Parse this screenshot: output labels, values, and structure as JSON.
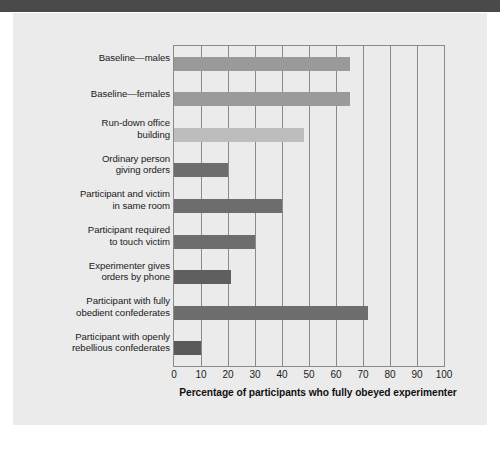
{
  "figure": {
    "panel_bg": "#ebebeb",
    "top_band_color": "#4a4a4a",
    "axis_color": "#8a8a8a"
  },
  "chart_data": {
    "type": "bar",
    "orientation": "horizontal",
    "title": "",
    "xlabel": "Percentage of participants who fully obeyed experimenter",
    "ylabel": "",
    "xlim": [
      0,
      100
    ],
    "xticks": [
      0,
      10,
      20,
      30,
      40,
      50,
      60,
      70,
      80,
      90,
      100
    ],
    "grid": true,
    "grid_axis": "x",
    "legend": null,
    "categories": [
      "Baseline—males",
      "Baseline—females",
      "Run-down office building",
      "Ordinary person giving orders",
      "Participant and victim in same room",
      "Participant required to touch victim",
      "Experimenter gives orders by phone",
      "Participant with fully obedient confederates",
      "Participant with openly rebellious confederates"
    ],
    "category_lines": [
      [
        "Baseline—males"
      ],
      [
        "Baseline—females"
      ],
      [
        "Run-down office",
        "building"
      ],
      [
        "Ordinary person",
        "giving orders"
      ],
      [
        "Participant and victim",
        "in same room"
      ],
      [
        "Participant required",
        "to touch victim"
      ],
      [
        "Experimenter gives",
        "orders by phone"
      ],
      [
        "Participant with fully",
        "obedient confederates"
      ],
      [
        "Participant with openly",
        "rebellious confederates"
      ]
    ],
    "values": [
      65,
      65,
      48,
      20,
      40,
      30,
      21,
      72,
      10
    ],
    "bar_colors": [
      "#9a9a9a",
      "#9a9a9a",
      "#bdbdbd",
      "#6d6d6d",
      "#6d6d6d",
      "#6d6d6d",
      "#5f5f5f",
      "#6d6d6d",
      "#5a5a5a"
    ]
  }
}
